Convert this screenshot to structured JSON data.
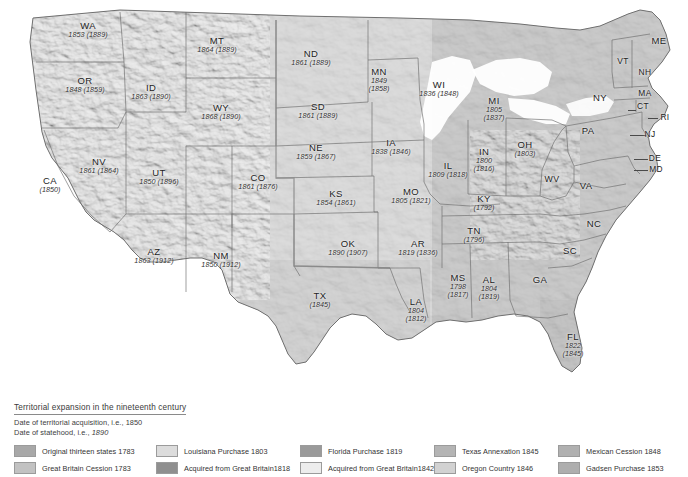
{
  "map": {
    "title": "Territorial expansion of the United States in the nineteenth century",
    "background_color": "#ffffff",
    "land_base_color": "#bdbdbd",
    "border_color": "#6f6f6f",
    "water_color": "#ffffff"
  },
  "legend": {
    "title": "Territorial expansion in the nineteenth century",
    "note_acquisition": "Date of territorial acquisition, i.e., 1850",
    "note_statehood_prefix": "Date of statehood, i.e., ",
    "note_statehood_value": "1890",
    "items": [
      {
        "label": "Original thirteen states 1783",
        "color": "#a8a8a8"
      },
      {
        "label": "Louisiana Purchase 1803",
        "color": "#dcdcdc"
      },
      {
        "label": "Florida Purchase 1819",
        "color": "#9a9a9a"
      },
      {
        "label": "Texas Annexation 1845",
        "color": "#b4b4b4"
      },
      {
        "label": "Mexican Cession 1848",
        "color": "#b0b0b0"
      },
      {
        "label": "Great Britain Cession  1783",
        "color": "#c2c2c2"
      },
      {
        "label": "Acquired from Great Britain1818",
        "color": "#8f8f8f"
      },
      {
        "label": "Acquired from Great Britain1842",
        "color": "#ededed"
      },
      {
        "label": "Oregon Country 1846",
        "color": "#d2d2d2"
      },
      {
        "label": "Gadsen Purchase 1853",
        "color": "#aeaeae"
      }
    ]
  },
  "states": [
    {
      "abbr": "WA",
      "dates": "1853 (1889)",
      "x": 88,
      "y": 30,
      "size": ""
    },
    {
      "abbr": "OR",
      "dates": "1848 (1859)",
      "x": 85,
      "y": 85,
      "size": ""
    },
    {
      "abbr": "ID",
      "dates": "1863 (1890)",
      "x": 151,
      "y": 92,
      "size": ""
    },
    {
      "abbr": "MT",
      "dates": "1864 (1889)",
      "x": 217,
      "y": 45,
      "size": ""
    },
    {
      "abbr": "WY",
      "dates": "1868 (1890)",
      "x": 221,
      "y": 112,
      "size": ""
    },
    {
      "abbr": "NV",
      "dates": "1861 (1864)",
      "x": 99,
      "y": 166,
      "size": ""
    },
    {
      "abbr": "UT",
      "dates": "1850 (1896)",
      "x": 159,
      "y": 177,
      "size": ""
    },
    {
      "abbr": "CA",
      "dates": "(1850)",
      "x": 50,
      "y": 185,
      "size": ""
    },
    {
      "abbr": "CO",
      "dates": "1861 (1876)",
      "x": 258,
      "y": 182,
      "size": ""
    },
    {
      "abbr": "AZ",
      "dates": "1863 (1912)",
      "x": 154,
      "y": 256,
      "size": ""
    },
    {
      "abbr": "NM",
      "dates": "1850 (1912)",
      "x": 221,
      "y": 260,
      "size": ""
    },
    {
      "abbr": "ND",
      "dates": "1861 (1889)",
      "x": 311,
      "y": 58,
      "size": ""
    },
    {
      "abbr": "SD",
      "dates": "1861 (1889)",
      "x": 318,
      "y": 111,
      "size": ""
    },
    {
      "abbr": "NE",
      "dates": "1859 (1867)",
      "x": 316,
      "y": 152,
      "size": ""
    },
    {
      "abbr": "KS",
      "dates": "1854 (1861)",
      "x": 336,
      "y": 198,
      "size": ""
    },
    {
      "abbr": "OK",
      "dates": "1890 (1907)",
      "x": 348,
      "y": 248,
      "size": ""
    },
    {
      "abbr": "TX",
      "dates": "(1845)",
      "x": 320,
      "y": 300,
      "size": ""
    },
    {
      "abbr": "MN",
      "dates": "1849\n(1858)",
      "x": 379,
      "y": 80,
      "size": ""
    },
    {
      "abbr": "IA",
      "dates": "1838 (1846)",
      "x": 391,
      "y": 147,
      "size": ""
    },
    {
      "abbr": "MO",
      "dates": "1805 (1821)",
      "x": 411,
      "y": 196,
      "size": ""
    },
    {
      "abbr": "AR",
      "dates": "1819 (1836)",
      "x": 418,
      "y": 248,
      "size": ""
    },
    {
      "abbr": "LA",
      "dates": "1804\n(1812)",
      "x": 416,
      "y": 310,
      "size": ""
    },
    {
      "abbr": "WI",
      "dates": "1836 (1848)",
      "x": 439,
      "y": 89,
      "size": ""
    },
    {
      "abbr": "IL",
      "dates": "1809 (1818)",
      "x": 448,
      "y": 170,
      "size": ""
    },
    {
      "abbr": "IN",
      "dates": "1800\n(1816)",
      "x": 484,
      "y": 160,
      "size": ""
    },
    {
      "abbr": "MI",
      "dates": "1805\n(1837)",
      "x": 494,
      "y": 109,
      "size": ""
    },
    {
      "abbr": "OH",
      "dates": "(1803)",
      "x": 525,
      "y": 149,
      "size": ""
    },
    {
      "abbr": "KY",
      "dates": "(1792)",
      "x": 484,
      "y": 203,
      "size": ""
    },
    {
      "abbr": "TN",
      "dates": "(1796)",
      "x": 474,
      "y": 235,
      "size": ""
    },
    {
      "abbr": "MS",
      "dates": "1798\n(1817)",
      "x": 458,
      "y": 286,
      "size": ""
    },
    {
      "abbr": "AL",
      "dates": "1804\n(1819)",
      "x": 489,
      "y": 288,
      "size": ""
    },
    {
      "abbr": "GA",
      "dates": "",
      "x": 540,
      "y": 280,
      "size": "plain"
    },
    {
      "abbr": "FL",
      "dates": "1822\n(1845)",
      "x": 573,
      "y": 345,
      "size": ""
    },
    {
      "abbr": "SC",
      "dates": "",
      "x": 570,
      "y": 251,
      "size": "plain"
    },
    {
      "abbr": "NC",
      "dates": "",
      "x": 594,
      "y": 224,
      "size": "plain"
    },
    {
      "abbr": "VA",
      "dates": "",
      "x": 586,
      "y": 186,
      "size": "plain"
    },
    {
      "abbr": "WV",
      "dates": "",
      "x": 552,
      "y": 180,
      "size": "plain small"
    },
    {
      "abbr": "PA",
      "dates": "",
      "x": 588,
      "y": 131,
      "size": "plain"
    },
    {
      "abbr": "NY",
      "dates": "",
      "x": 600,
      "y": 98,
      "size": "plain"
    },
    {
      "abbr": "ME",
      "dates": "",
      "x": 659,
      "y": 41,
      "size": "plain"
    },
    {
      "abbr": "VT",
      "dates": "",
      "x": 623,
      "y": 62,
      "size": "plain tiny"
    },
    {
      "abbr": "NH",
      "dates": "",
      "x": 645,
      "y": 73,
      "size": "plain tiny"
    },
    {
      "abbr": "MA",
      "dates": "",
      "x": 645,
      "y": 94,
      "size": "plain tiny"
    },
    {
      "abbr": "CT",
      "dates": "",
      "x": 643,
      "y": 107,
      "size": "plain tiny"
    },
    {
      "abbr": "RI",
      "dates": "",
      "x": 665,
      "y": 118,
      "size": "plain tiny"
    },
    {
      "abbr": "NJ",
      "dates": "",
      "x": 650,
      "y": 135,
      "size": "plain tiny"
    },
    {
      "abbr": "DE",
      "dates": "",
      "x": 655,
      "y": 159,
      "size": "plain tiny"
    },
    {
      "abbr": "MD",
      "dates": "",
      "x": 656,
      "y": 170,
      "size": "plain tiny"
    }
  ]
}
